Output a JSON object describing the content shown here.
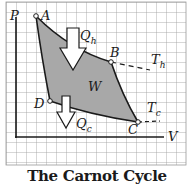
{
  "caption": "The Carnot Cycle",
  "axes": {
    "y_label": "P",
    "x_label": "V"
  },
  "points": [
    {
      "name": "A",
      "x": 36,
      "y": 16
    },
    {
      "name": "B",
      "x": 111,
      "y": 62
    },
    {
      "name": "C",
      "x": 138,
      "y": 122
    },
    {
      "name": "D",
      "x": 50,
      "y": 101
    }
  ],
  "labels": {
    "work": "W",
    "heat_in": "Q",
    "heat_in_sub": "h",
    "heat_out": "Q",
    "heat_out_sub": "c",
    "hot_isotherm": "T",
    "hot_isotherm_sub": "h",
    "cold_isotherm": "T",
    "cold_isotherm_sub": "c"
  },
  "colors": {
    "grid": "#9a9a9a",
    "fill": "#a8a8a8",
    "line": "#1a1a1a",
    "arrow_fill": "#ffffff"
  }
}
